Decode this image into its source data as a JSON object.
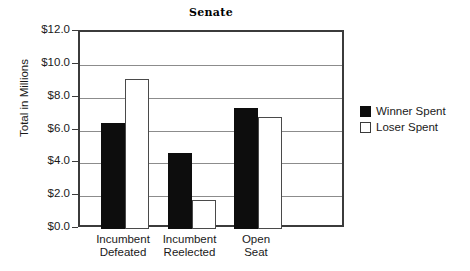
{
  "chart_data": {
    "type": "bar",
    "title": "Senate",
    "xlabel": "",
    "ylabel": "Total in Millions",
    "categories": [
      "Incumbent Defeated",
      "Incumbent Reelected",
      "Open Seat"
    ],
    "category_lines": [
      [
        "Incumbent",
        "Defeated"
      ],
      [
        "Incumbent",
        "Reelected"
      ],
      [
        "Open",
        "Seat"
      ]
    ],
    "series": [
      {
        "name": "Winner Spent",
        "values": [
          6.45,
          4.65,
          7.35
        ],
        "color": "#0d0d0d"
      },
      {
        "name": "Loser Spent",
        "values": [
          9.15,
          1.75,
          6.85
        ],
        "color": "#ffffff"
      }
    ],
    "ylim": [
      0,
      12
    ],
    "ytick_values": [
      0,
      2,
      4,
      6,
      8,
      10,
      12
    ],
    "ytick_labels": [
      "$0.0",
      "$2.0",
      "$4.0",
      "$6.0",
      "$8.0",
      "$10.0",
      "$12.0"
    ],
    "grid": true,
    "legend_position": "right"
  },
  "legend": {
    "items": [
      {
        "label": "Winner Spent",
        "swatch": "filled-black-square"
      },
      {
        "label": "Loser Spent",
        "swatch": "outlined-white-square"
      }
    ]
  }
}
